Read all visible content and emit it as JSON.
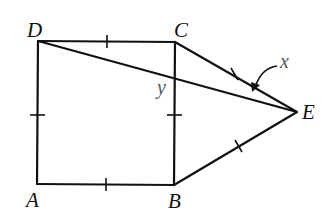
{
  "diagram": {
    "type": "geometry",
    "points": {
      "A": {
        "label": "A",
        "x": 37,
        "y": 184
      },
      "B": {
        "label": "B",
        "x": 174,
        "y": 185
      },
      "C": {
        "label": "C",
        "x": 175,
        "y": 42
      },
      "D": {
        "label": "D",
        "x": 38,
        "y": 41
      },
      "E": {
        "label": "E",
        "x": 297,
        "y": 112
      }
    },
    "angle_labels": {
      "x": "x",
      "y": "y"
    },
    "segments": [
      "AB",
      "BC",
      "CD",
      "DA",
      "CE",
      "BE",
      "DE"
    ],
    "tick_marks": [
      "AB",
      "BC",
      "CD",
      "DA",
      "CE",
      "BE"
    ]
  }
}
